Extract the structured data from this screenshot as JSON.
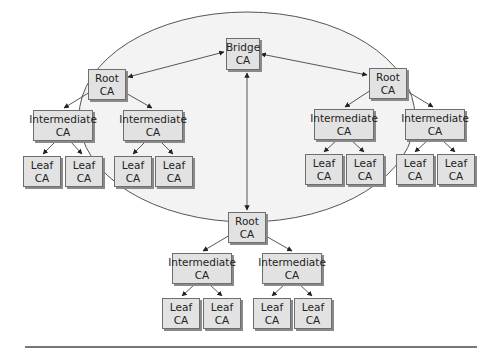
{
  "diagram": {
    "bridge": {
      "line1": "Bridge",
      "line2": "CA"
    },
    "hierarchies": [
      {
        "position": "left",
        "root": {
          "line1": "Root",
          "line2": "CA"
        },
        "intermediates": [
          {
            "line1": "Intermediate",
            "line2": "CA",
            "leaves": [
              {
                "line1": "Leaf",
                "line2": "CA"
              },
              {
                "line1": "Leaf",
                "line2": "CA"
              }
            ]
          },
          {
            "line1": "Intermediate",
            "line2": "CA",
            "leaves": [
              {
                "line1": "Leaf",
                "line2": "CA"
              },
              {
                "line1": "Leaf",
                "line2": "CA"
              }
            ]
          }
        ]
      },
      {
        "position": "right",
        "root": {
          "line1": "Root",
          "line2": "CA"
        },
        "intermediates": [
          {
            "line1": "Intermediate",
            "line2": "CA",
            "leaves": [
              {
                "line1": "Leaf",
                "line2": "CA"
              },
              {
                "line1": "Leaf",
                "line2": "CA"
              }
            ]
          },
          {
            "line1": "Intermediate",
            "line2": "CA",
            "leaves": [
              {
                "line1": "Leaf",
                "line2": "CA"
              },
              {
                "line1": "Leaf",
                "line2": "CA"
              }
            ]
          }
        ]
      },
      {
        "position": "bottom",
        "root": {
          "line1": "Root",
          "line2": "CA"
        },
        "intermediates": [
          {
            "line1": "Intermediate",
            "line2": "CA",
            "leaves": [
              {
                "line1": "Leaf",
                "line2": "CA"
              },
              {
                "line1": "Leaf",
                "line2": "CA"
              }
            ]
          },
          {
            "line1": "Intermediate",
            "line2": "CA",
            "leaves": [
              {
                "line1": "Leaf",
                "line2": "CA"
              },
              {
                "line1": "Leaf",
                "line2": "CA"
              }
            ]
          }
        ]
      }
    ],
    "colors": {
      "ellipse_fill": "#f3f3f3",
      "box_fill": "#e2e2e2",
      "line": "#444444"
    }
  }
}
